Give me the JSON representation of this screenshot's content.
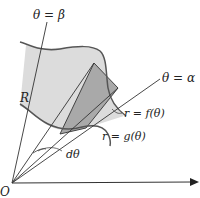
{
  "diagram": {
    "top_cutoff_text": "",
    "labels": {
      "beta_ray": "θ = β",
      "alpha_ray": "θ = α",
      "region": "R",
      "outer_curve": "r = f(θ)",
      "inner_curve": "r = g(θ)",
      "angle_increment": "dθ",
      "origin": "O"
    },
    "colors": {
      "region_fill": "#dcdcdc",
      "sector_fill": "#a9a9a9",
      "stroke": "#333333",
      "curve_stroke": "#555555"
    }
  }
}
